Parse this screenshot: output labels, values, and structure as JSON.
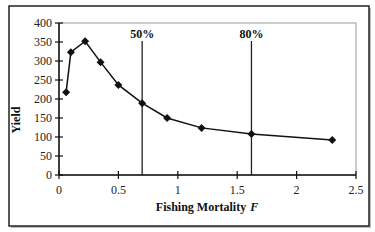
{
  "chart_data": {
    "type": "line",
    "title": "",
    "xlabel": "Fishing Mortality",
    "xlabel_italic_suffix": "F",
    "ylabel": "Yield",
    "xlim": [
      0,
      2.5
    ],
    "ylim": [
      0,
      400
    ],
    "x_ticks": [
      0,
      0.5,
      1,
      1.5,
      2,
      2.5
    ],
    "x_tick_labels": [
      "0",
      "0.5",
      "1",
      "1.5",
      "2",
      "2.5"
    ],
    "y_ticks": [
      0,
      50,
      100,
      150,
      200,
      250,
      300,
      350,
      400
    ],
    "y_tick_labels": [
      "0",
      "50",
      "100",
      "150",
      "200",
      "250",
      "300",
      "350",
      "400"
    ],
    "grid": false,
    "legend": null,
    "series": [
      {
        "name": "Yield",
        "marker": "diamond",
        "color": "#111111",
        "x": [
          0.06,
          0.1,
          0.22,
          0.35,
          0.5,
          0.7,
          0.91,
          1.2,
          1.62,
          2.3
        ],
        "y": [
          218,
          323,
          352,
          297,
          237,
          189,
          150,
          124,
          108,
          92
        ]
      }
    ],
    "reference_lines": [
      {
        "label": "50%",
        "x": 0.7
      },
      {
        "label": "80%",
        "x": 1.62
      }
    ]
  },
  "colors": {
    "line": "#111111",
    "axis": "#111111",
    "plot_border": "#9a9a9a",
    "frame": "#222222",
    "background": "#ffffff"
  }
}
